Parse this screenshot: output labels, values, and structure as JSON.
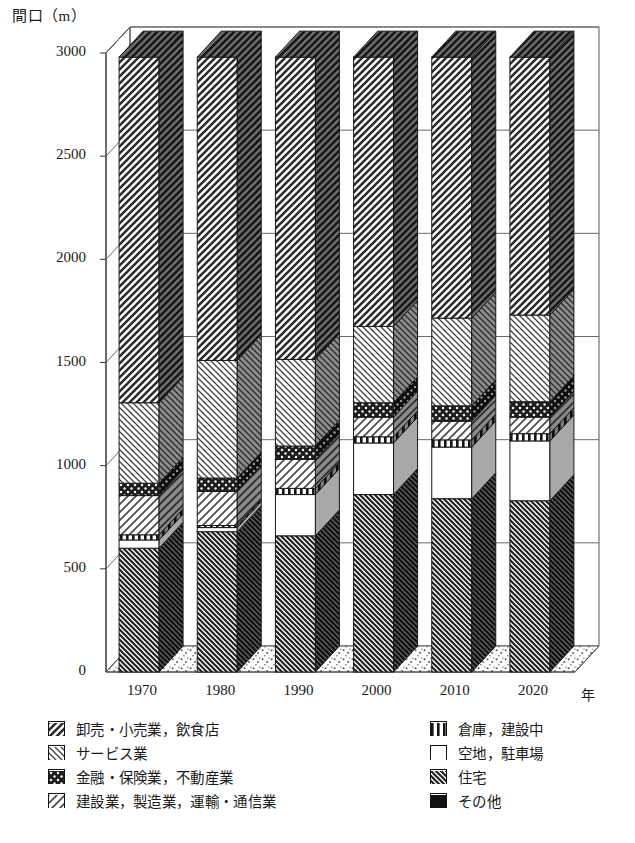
{
  "axis": {
    "y_title": "間口（m）",
    "x_unit": "年",
    "y_ticks": [
      "3000",
      "2500",
      "2000",
      "1500",
      "1000",
      "500",
      "0"
    ],
    "x_ticks": [
      "1970",
      "1980",
      "1990",
      "2000",
      "2010",
      "2020"
    ]
  },
  "legend": {
    "left": [
      {
        "key": "wholesale-retail-food",
        "label": "卸売・小売業，飲食店",
        "pattern": "diag-down-wide"
      },
      {
        "key": "service",
        "label": "サービス業",
        "pattern": "diag-up"
      },
      {
        "key": "finance-insurance-realestate",
        "label": "金融・保険業，不動産業",
        "pattern": "dots-dark"
      },
      {
        "key": "construction-manufacturing-transport",
        "label": "建設業，製造業，運輸・通信業",
        "pattern": "diag-down-light"
      }
    ],
    "right": [
      {
        "key": "warehouse-underconstruction",
        "label": "倉庫，建設中",
        "pattern": "vertical"
      },
      {
        "key": "vacant-parking",
        "label": "空地，駐車場",
        "pattern": "white"
      },
      {
        "key": "housing",
        "label": "住宅",
        "pattern": "diag-up-dense"
      },
      {
        "key": "other",
        "label": "その他",
        "pattern": "solid-black"
      }
    ]
  },
  "caption": "",
  "chart_data": {
    "type": "bar",
    "subtype": "stacked-3d-column",
    "title": "",
    "xlabel": "年",
    "ylabel": "間口（m）",
    "ylim": [
      0,
      3000
    ],
    "ytick_step": 500,
    "grid": true,
    "legend_position": "below",
    "categories": [
      "1970",
      "1980",
      "1990",
      "2000",
      "2010",
      "2020"
    ],
    "series": [
      {
        "name": "住宅",
        "key": "housing",
        "pattern": "diag-up-dense",
        "values": [
          600,
          680,
          660,
          860,
          840,
          830
        ]
      },
      {
        "name": "空地，駐車場",
        "key": "vacant-parking",
        "pattern": "white",
        "values": [
          40,
          20,
          200,
          250,
          250,
          290
        ]
      },
      {
        "name": "倉庫，建設中",
        "key": "warehouse-underconstruction",
        "pattern": "vertical",
        "values": [
          25,
          10,
          30,
          30,
          35,
          35
        ]
      },
      {
        "name": "建設業，製造業，運輸・通信業",
        "key": "construction-manufacturing-transport",
        "pattern": "diag-down-light",
        "values": [
          190,
          165,
          140,
          95,
          90,
          80
        ]
      },
      {
        "name": "金融・保険業，不動産業",
        "key": "finance-insurance-realestate",
        "pattern": "dots-dark",
        "values": [
          60,
          65,
          65,
          70,
          75,
          75
        ]
      },
      {
        "name": "サービス業",
        "key": "service",
        "pattern": "diag-up",
        "values": [
          390,
          570,
          420,
          370,
          425,
          420
        ]
      },
      {
        "name": "卸売・小売業，飲食店",
        "key": "wholesale-retail-food",
        "pattern": "diag-down-wide",
        "values": [
          1675,
          1470,
          1465,
          1305,
          1265,
          1250
        ]
      }
    ],
    "totals": [
      2980,
      2980,
      2980,
      2980,
      2980,
      2980
    ],
    "cumulative_tops": {
      "1970": [
        600,
        640,
        665,
        855,
        915,
        1305,
        2980
      ],
      "1980": [
        680,
        700,
        710,
        875,
        940,
        1510,
        2980
      ],
      "1990": [
        660,
        860,
        890,
        1030,
        1095,
        1515,
        2980
      ],
      "2000": [
        860,
        1110,
        1140,
        1235,
        1305,
        1675,
        2980
      ],
      "2010": [
        840,
        1090,
        1125,
        1215,
        1290,
        1715,
        2980
      ],
      "2020": [
        830,
        1120,
        1155,
        1235,
        1310,
        1730,
        2980
      ]
    }
  }
}
